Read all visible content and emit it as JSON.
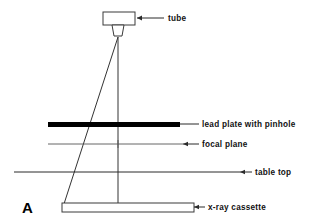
{
  "figure": {
    "panel_letter": "A",
    "title": "",
    "width": 326,
    "height": 224,
    "background_color": "#ffffff",
    "line_color": "#2b2b2b",
    "lead_plate_color": "#000000"
  },
  "labels": {
    "tube": "tube",
    "lead_plate": "lead plate with pinhole",
    "focal_plane": "focal plane",
    "table_top": "table top",
    "cassette": "x-ray cassette"
  },
  "components": [
    {
      "id": "tube",
      "name": "x-ray tube",
      "label": "tube",
      "shape": "t-shaped-housing",
      "label_x": 168,
      "label_y": 20
    },
    {
      "id": "lead-plate",
      "name": "lead plate with pinhole",
      "label": "lead plate with pinhole",
      "shape": "thick-black-bar",
      "label_x": 202,
      "label_y": 125
    },
    {
      "id": "focal-plane",
      "name": "focal plane",
      "label": "focal plane",
      "shape": "thin-horizontal-line-with-cross",
      "label_x": 202,
      "label_y": 147
    },
    {
      "id": "table-top",
      "name": "table top",
      "label": "table top",
      "shape": "long-horizontal-line",
      "label_x": 255,
      "label_y": 175
    },
    {
      "id": "cassette",
      "name": "x-ray cassette",
      "label": "x-ray cassette",
      "shape": "hollow-rectangle",
      "label_x": 208,
      "label_y": 205
    }
  ],
  "geometry": {
    "apex_x": 118,
    "apex_y": 37,
    "central_ray": {
      "x1": 118,
      "y1": 37,
      "x2": 118,
      "y2": 207
    },
    "oblique_ray": {
      "x1": 118,
      "y1": 37,
      "x2": 63,
      "y2": 207
    },
    "lead_plate": {
      "x": 48,
      "y": 122,
      "width": 132,
      "height": 5
    },
    "focal_plane_line": {
      "x1": 48,
      "y1": 144,
      "x2": 183,
      "y2": 144
    },
    "table_top_line": {
      "x1": 14,
      "y1": 172,
      "x2": 240,
      "y2": 172
    },
    "cassette_rect": {
      "x": 62,
      "y": 203,
      "width": 132,
      "height": 9
    },
    "cross_marker": {
      "x": 118,
      "y": 144,
      "size": 4
    }
  }
}
